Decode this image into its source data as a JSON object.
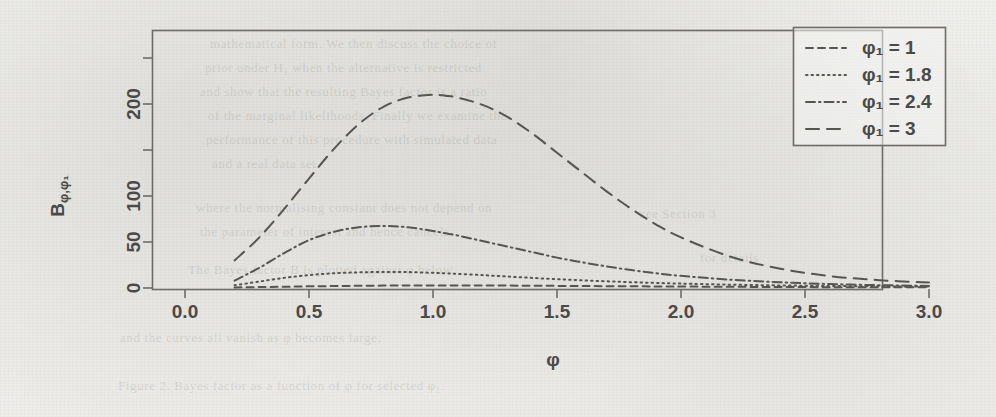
{
  "figure": {
    "kind": "scanned-plot",
    "background_color": "#f2f2f0",
    "ink_color": "#575552",
    "axis_color": "#6e6c68"
  },
  "axes": {
    "y_title": "B",
    "y_title_sub": "φ,φ₁",
    "x_title": "φ",
    "x_ticks": [
      "0.0",
      "0.5",
      "1.0",
      "1.5",
      "2.0",
      "2.5",
      "3.0"
    ],
    "x_tick_values": [
      0.0,
      0.5,
      1.0,
      1.5,
      2.0,
      2.5,
      3.0
    ],
    "y_ticks": [
      "0",
      "50",
      "100",
      "200"
    ],
    "y_tick_values": [
      0,
      50,
      100,
      200
    ],
    "y_minor_tick_values": [
      150,
      250
    ]
  },
  "legend": {
    "position": "top-right",
    "items": [
      {
        "label": "φ₁ = 1",
        "dash": "7,5",
        "series": "phi1_1"
      },
      {
        "label": "φ₁ = 1.8",
        "dash": "1.5,4",
        "series": "phi1_18"
      },
      {
        "label": "φ₁ = 2.4",
        "dash": "9,4,1.5,4",
        "series": "phi1_24"
      },
      {
        "label": "φ₁ = 3",
        "dash": "13,8",
        "series": "phi1_3"
      }
    ]
  },
  "chart_data": {
    "type": "line",
    "title": "",
    "xlabel": "φ",
    "ylabel": "B_{φ,φ₁}",
    "xlim": [
      0.0,
      3.0
    ],
    "ylim": [
      0,
      265
    ],
    "grid": false,
    "legend_position": "top-right",
    "x": [
      0.2,
      0.3,
      0.4,
      0.5,
      0.6,
      0.7,
      0.8,
      0.9,
      1.0,
      1.05,
      1.1,
      1.2,
      1.3,
      1.4,
      1.5,
      1.6,
      1.7,
      1.8,
      1.9,
      2.0,
      2.2,
      2.4,
      2.6,
      2.8,
      3.0
    ],
    "series": [
      {
        "name": "φ₁ = 1",
        "dash": "7,5",
        "values": [
          0.6,
          1.0,
          1.4,
          1.8,
          2.1,
          2.4,
          2.6,
          2.7,
          2.8,
          2.8,
          2.8,
          2.7,
          2.6,
          2.5,
          2.3,
          2.2,
          2.0,
          1.9,
          1.7,
          1.6,
          1.3,
          1.1,
          0.9,
          0.8,
          0.7
        ]
      },
      {
        "name": "φ₁ = 1.8",
        "dash": "1.5,4",
        "values": [
          3.0,
          7.0,
          11.0,
          14.0,
          16.0,
          17.0,
          17.5,
          17.3,
          16.5,
          16.0,
          15.4,
          14.0,
          12.5,
          11.0,
          9.6,
          8.4,
          7.3,
          6.3,
          5.5,
          4.8,
          3.6,
          2.8,
          2.2,
          1.8,
          1.5
        ]
      },
      {
        "name": "φ₁ = 2.4",
        "dash": "9,4,1.5,4",
        "values": [
          8.0,
          22.0,
          38.0,
          52.0,
          61.0,
          66.0,
          67.5,
          66.0,
          62.0,
          59.5,
          57.0,
          51.0,
          45.0,
          39.0,
          33.0,
          28.0,
          23.5,
          19.5,
          16.0,
          13.2,
          9.0,
          6.2,
          4.3,
          3.1,
          2.3
        ]
      },
      {
        "name": "φ₁ = 3",
        "dash": "13,8",
        "values": [
          30.0,
          55.0,
          86.0,
          119.0,
          151.0,
          178.0,
          197.0,
          207.0,
          210.0,
          209.0,
          207.0,
          199.0,
          186.0,
          168.0,
          147.0,
          126.0,
          105.0,
          86.0,
          69.0,
          55.0,
          34.0,
          21.0,
          13.0,
          8.5,
          6.0
        ]
      }
    ]
  },
  "ghost_text": {
    "lines": [
      {
        "x": 210,
        "y": 36,
        "text": "mathematical  form.  We  then  discuss  the  choice  of"
      },
      {
        "x": 205,
        "y": 60,
        "text": "prior  under  H₁  when  the  alternative  is  restricted"
      },
      {
        "x": 200,
        "y": 84,
        "text": "and  show  that  the  resulting  Bayes  factor  is  a  ratio"
      },
      {
        "x": 208,
        "y": 108,
        "text": "of  the  marginal  likelihoods.  Finally  we  examine  the"
      },
      {
        "x": 206,
        "y": 132,
        "text": "performance  of  this  procedure  with  simulated  data"
      },
      {
        "x": 212,
        "y": 156,
        "text": "and  a  real  data  set."
      },
      {
        "x": 196,
        "y": 200,
        "text": "where  the  normalising  constant  does  not  depend  on"
      },
      {
        "x": 200,
        "y": 224,
        "text": "the  parameter  of  interest  and  hence  cancels."
      },
      {
        "x": 188,
        "y": 262,
        "text": "The  Bayes  factor  B  is  plotted  against  φ  below."
      },
      {
        "x": 120,
        "y": 330,
        "text": "and  the  curves  all  vanish  as  φ  becomes  large."
      },
      {
        "x": 118,
        "y": 378,
        "text": "Figure  2.  Bayes  factor  as  a  function  of  φ  for  selected  φ₁."
      },
      {
        "x": 640,
        "y": 206,
        "text": "see  Section  3"
      },
      {
        "x": 700,
        "y": 250,
        "text": "for  details"
      }
    ]
  }
}
